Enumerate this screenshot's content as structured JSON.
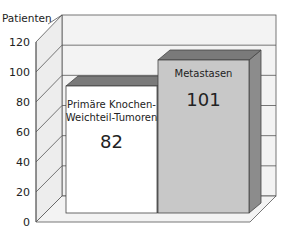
{
  "chart_data": {
    "type": "bar",
    "title": "",
    "xlabel": "",
    "ylabel": "Patienten",
    "ylim": [
      0,
      120
    ],
    "yticks": [
      0,
      20,
      40,
      60,
      80,
      100,
      120
    ],
    "grid": true,
    "style": "3d",
    "categories": [
      "Primäre Knochen-Weichteil-Tumoren",
      "Metastasen"
    ],
    "values": [
      82,
      101
    ],
    "bars": [
      {
        "label_line1": "Primäre Knochen-",
        "label_line2": "Weichteil-Tumoren",
        "value": 82,
        "value_label": "82",
        "color": "#ffffff"
      },
      {
        "label_line1": "Metastasen",
        "label_line2": "",
        "value": 101,
        "value_label": "101",
        "color": "#c8c8c8"
      }
    ]
  },
  "axis": {
    "ylabel": "Patienten",
    "ticks": [
      "0",
      "20",
      "40",
      "60",
      "80",
      "100",
      "120"
    ]
  },
  "colors": {
    "wall": "#f2f2f2",
    "grid": "#555555",
    "bar1_front": "#ffffff",
    "bar1_top": "#7a7a7a",
    "bar2_front": "#c8c8c8",
    "bar2_top": "#7a7a7a",
    "bar2_side": "#8c8c8c"
  }
}
